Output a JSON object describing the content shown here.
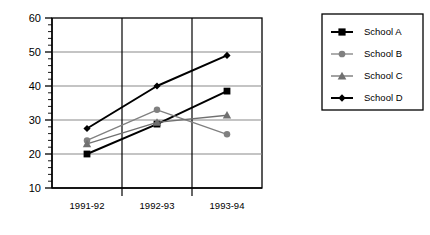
{
  "chart_data": {
    "type": "line",
    "title": "",
    "xlabel": "",
    "ylabel": "",
    "categories": [
      "1991-92",
      "1992-93",
      "1993-94"
    ],
    "ylim": [
      10,
      60
    ],
    "yticks": [
      10,
      20,
      30,
      40,
      50,
      60
    ],
    "ytick_labels": [
      "10",
      "20",
      "30",
      "40",
      "50",
      "60"
    ],
    "grid": "horizontal-and-vertical",
    "legend_position": "right",
    "series": [
      {
        "name": "School A",
        "values": [
          20,
          28.8,
          38.5
        ],
        "color": "#000000",
        "marker": "square"
      },
      {
        "name": "School B",
        "values": [
          24,
          33,
          25.8
        ],
        "color": "#808080",
        "marker": "circle"
      },
      {
        "name": "School C",
        "values": [
          23,
          29.3,
          31.4
        ],
        "color": "#707070",
        "marker": "triangle"
      },
      {
        "name": "School D",
        "values": [
          27.5,
          40,
          49
        ],
        "color": "#000000",
        "marker": "diamond"
      }
    ]
  },
  "axes": {
    "y_tick_0": "60",
    "y_tick_1": "50",
    "y_tick_2": "40",
    "y_tick_3": "30",
    "y_tick_4": "20",
    "y_tick_5": "10",
    "x_tick_0": "1991-92",
    "x_tick_1": "1992-93",
    "x_tick_2": "1993-94"
  },
  "legend": {
    "items": [
      {
        "label": "School A"
      },
      {
        "label": "School B"
      },
      {
        "label": "School C"
      },
      {
        "label": "School D"
      }
    ]
  },
  "colors": {
    "series_a": "#000000",
    "series_b": "#808080",
    "series_c": "#707070",
    "series_d": "#000000",
    "gridline": "#888888",
    "axis": "#000000",
    "background": "#ffffff"
  }
}
